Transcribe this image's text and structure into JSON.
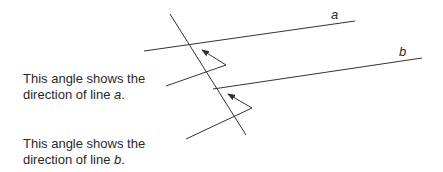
{
  "diagram": {
    "type": "parallel-lines-transversal",
    "stroke_color": "#333333",
    "lines": {
      "a": {
        "label": "a",
        "from": [
          144,
          51
        ],
        "to": [
          355,
          21
        ]
      },
      "b": {
        "label": "b",
        "from": [
          213,
          89
        ],
        "to": [
          422,
          58
        ]
      },
      "transversal": {
        "from": [
          170,
          14
        ],
        "to": [
          246,
          135
        ]
      }
    },
    "angle_indicators": [
      {
        "for_line": "a",
        "arrow_tip": [
          202,
          50
        ],
        "vertex": [
          226,
          65
        ],
        "tail": [
          166,
          86
        ]
      },
      {
        "for_line": "b",
        "arrow_tip": [
          228,
          94
        ],
        "vertex": [
          252,
          108
        ],
        "tail": [
          186,
          139
        ]
      }
    ]
  },
  "captions": {
    "a": {
      "line1": "This angle shows the",
      "line2_prefix": "direction of line ",
      "line2_var": "a",
      "line2_suffix": "."
    },
    "b": {
      "line1": "This angle shows the",
      "line2_prefix": "direction of line ",
      "line2_var": "b",
      "line2_suffix": "."
    }
  },
  "labels": {
    "a": "a",
    "b": "b"
  }
}
